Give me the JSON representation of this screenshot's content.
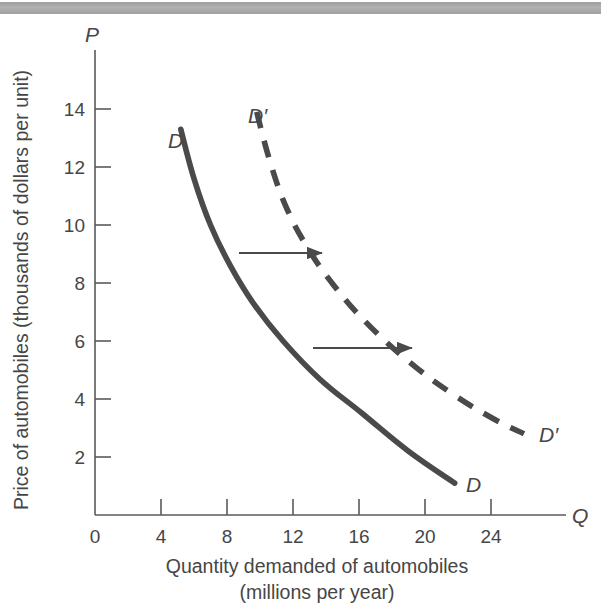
{
  "figure": {
    "name": "demand-curve-shift-figure",
    "top_rule_color": "#a9a9a9",
    "background": "#ffffff",
    "curve_color": "#4a4a4a",
    "axis_color": "#5a5a5a"
  },
  "chart_data": {
    "type": "line",
    "title": "",
    "xlabel": "Quantity demanded of automobiles",
    "xlabel_line2": "(millions per year)",
    "ylabel": "Price of automobiles (thousands of dollars per unit)",
    "x_axis_symbol": "Q",
    "y_axis_symbol": "P",
    "xlim": [
      0,
      26
    ],
    "ylim": [
      0,
      15.4
    ],
    "xticks": [
      0,
      4,
      8,
      12,
      16,
      20,
      24
    ],
    "yticks": [
      2,
      4,
      6,
      8,
      10,
      12,
      14
    ],
    "xtick_labels": [
      "0",
      "4",
      "8",
      "12",
      "16",
      "20",
      "24"
    ],
    "ytick_labels": [
      "2",
      "4",
      "6",
      "8",
      "10",
      "12",
      "14"
    ],
    "grid": false,
    "legend": "none",
    "series": [
      {
        "name": "D",
        "label": "D",
        "style": "solid",
        "label_start": "D",
        "label_end": "D",
        "points": [
          [
            5.2,
            13.3
          ],
          [
            6.0,
            11.6
          ],
          [
            7.0,
            10.0
          ],
          [
            8.2,
            8.6
          ],
          [
            9.6,
            7.3
          ],
          [
            11.4,
            6.0
          ],
          [
            13.6,
            4.7
          ],
          [
            16.2,
            3.5
          ],
          [
            19.0,
            2.2
          ],
          [
            21.8,
            1.1
          ]
        ]
      },
      {
        "name": "D'",
        "label": "D′",
        "style": "dashed",
        "label_start": "D′",
        "label_end": "D′",
        "points": [
          [
            9.8,
            13.9
          ],
          [
            10.6,
            12.2
          ],
          [
            11.6,
            10.6
          ],
          [
            12.9,
            9.2
          ],
          [
            14.5,
            7.9
          ],
          [
            16.5,
            6.6
          ],
          [
            19.0,
            5.3
          ],
          [
            21.6,
            4.2
          ],
          [
            24.2,
            3.3
          ],
          [
            26.0,
            2.8
          ]
        ]
      }
    ],
    "annotations": [
      {
        "name": "shift-arrow-upper",
        "type": "arrow",
        "from": [
          2.2,
          9.3
        ],
        "to": [
          3.4,
          9.3
        ],
        "x_from_px": 239,
        "x_to_px": 322,
        "y_px": 253
      },
      {
        "name": "shift-arrow-lower",
        "type": "arrow",
        "from": [
          3.4,
          6.0
        ],
        "to": [
          4.8,
          6.0
        ],
        "x_from_px": 313,
        "x_to_px": 412,
        "y_px": 348
      }
    ]
  }
}
